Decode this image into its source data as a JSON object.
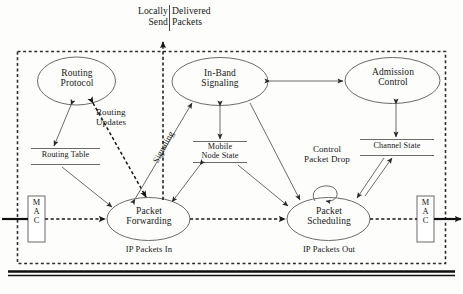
{
  "diagram": {
    "type": "block-flow-diagram",
    "boundary": {
      "name": "mobile-node-boundary",
      "style": "dashed-rectangle"
    },
    "baseline": {
      "name": "wireless-medium-line",
      "style": "thick-double-horizontal-line"
    }
  },
  "top_annotation": {
    "left_line1": "Locally",
    "left_line2": "Send",
    "right_line1": "Delivered",
    "right_line2": "Packets",
    "divider": "|"
  },
  "nodes": [
    {
      "id": "routing-protocol",
      "line1": "Routing",
      "line2": "Protocol",
      "shape": "ellipse"
    },
    {
      "id": "in-band-signaling",
      "line1": "In-Band",
      "line2": "Signaling",
      "shape": "ellipse"
    },
    {
      "id": "admission-control",
      "line1": "Admission",
      "line2": "Control",
      "shape": "ellipse"
    },
    {
      "id": "packet-forwarding",
      "line1": "Packet",
      "line2": "Forwarding",
      "shape": "ellipse"
    },
    {
      "id": "packet-scheduling",
      "line1": "Packet",
      "line2": "Scheduling",
      "shape": "ellipse"
    }
  ],
  "datastores": [
    {
      "id": "routing-table",
      "line1": "Routing Table",
      "line2": ""
    },
    {
      "id": "mobile-node-state",
      "line1": "Mobile",
      "line2": "Node State"
    },
    {
      "id": "channel-state",
      "line1": "Channel State",
      "line2": ""
    }
  ],
  "edge_labels": {
    "routing_updates_line1": "Routing",
    "routing_updates_line2": "Updates",
    "signaling": "Signaling",
    "control_packet_drop_line1": "Control",
    "control_packet_drop_line2": "Packet Drop"
  },
  "io_labels": {
    "packets_in": "IP Packets In",
    "packets_out": "IP Packets Out"
  },
  "mac_boxes": {
    "left": "M\nA\nC",
    "right": "M\nA\nC",
    "letters": [
      "M",
      "A",
      "C"
    ]
  },
  "colors": {
    "stroke": "#4a4a4a",
    "text": "#171717",
    "dashed_boundary": "#2e2e2e",
    "background": "#fdfdfc",
    "baseline": "#111111"
  }
}
